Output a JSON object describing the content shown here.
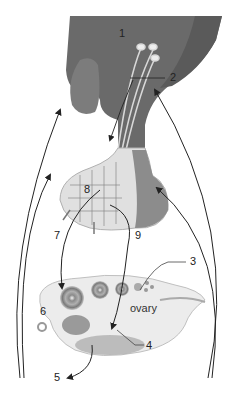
{
  "diagram": {
    "type": "anatomical-illustration",
    "labels": [
      {
        "id": "1",
        "text": "1",
        "x": 121,
        "y": 28
      },
      {
        "id": "2",
        "text": "2",
        "x": 171,
        "y": 72
      },
      {
        "id": "3",
        "text": "3",
        "x": 192,
        "y": 257
      },
      {
        "id": "4",
        "text": "4",
        "x": 146,
        "y": 345
      },
      {
        "id": "5",
        "text": "5",
        "x": 55,
        "y": 375
      },
      {
        "id": "6",
        "text": "6",
        "x": 40,
        "y": 307
      },
      {
        "id": "7",
        "text": "7",
        "x": 54,
        "y": 231
      },
      {
        "id": "8",
        "text": "8",
        "x": 85,
        "y": 184
      },
      {
        "id": "9",
        "text": "9",
        "x": 135,
        "y": 231
      },
      {
        "id": "ovary",
        "text": "ovary",
        "x": 128,
        "y": 305
      }
    ],
    "colors": {
      "hypothalamus": "#6e6e6e",
      "hypothalamus_edge": "#555555",
      "pituitary_anterior": "#dcdcdc",
      "pituitary_posterior": "#8a8a8a",
      "ovary": "#e9e9e9",
      "follicle": "#9a9a9a",
      "arrow": "#222222",
      "background": "#ffffff"
    }
  }
}
